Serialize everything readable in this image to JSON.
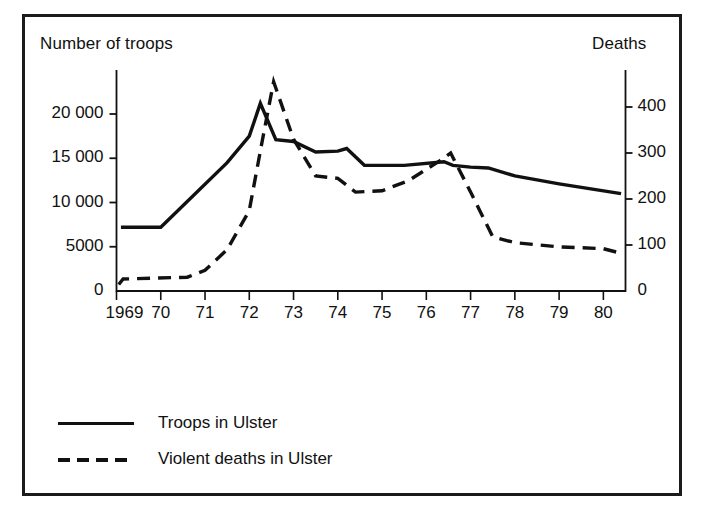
{
  "chart_data": {
    "type": "line",
    "title": "",
    "xlabel": "",
    "ylabel": "Number of troops",
    "y2label": "Deaths",
    "grid": false,
    "legend_position": "bottom-left",
    "x": [
      "1969",
      "70",
      "71",
      "72",
      "73",
      "74",
      "75",
      "76",
      "77",
      "78",
      "79",
      "80"
    ],
    "xtick_labels": [
      "1969",
      "70",
      "71",
      "72",
      "73",
      "74",
      "75",
      "76",
      "77",
      "78",
      "79",
      "80"
    ],
    "xlim": [
      1969,
      1980.5
    ],
    "ylim": [
      0,
      23000
    ],
    "ytick_labels": [
      "0",
      "5000",
      "10 000",
      "15 000",
      "20 000"
    ],
    "ytick_values": [
      0,
      5000,
      10000,
      15000,
      20000
    ],
    "y2lim": [
      0,
      470
    ],
    "y2tick_labels": [
      "0",
      "100",
      "200",
      "300",
      "400"
    ],
    "y2tick_values": [
      0,
      100,
      200,
      300,
      400
    ],
    "series": [
      {
        "name": "Troops in Ulster",
        "axis": "left",
        "style": "solid",
        "color": "#111111",
        "points": [
          {
            "x": 1969.1,
            "y": 7200
          },
          {
            "x": 1970.0,
            "y": 7200
          },
          {
            "x": 1971.5,
            "y": 14500
          },
          {
            "x": 1972.0,
            "y": 17500
          },
          {
            "x": 1972.25,
            "y": 21200
          },
          {
            "x": 1972.6,
            "y": 17100
          },
          {
            "x": 1973.0,
            "y": 16900
          },
          {
            "x": 1973.5,
            "y": 15700
          },
          {
            "x": 1974.0,
            "y": 15800
          },
          {
            "x": 1974.2,
            "y": 16100
          },
          {
            "x": 1974.6,
            "y": 14200
          },
          {
            "x": 1975.5,
            "y": 14200
          },
          {
            "x": 1976.4,
            "y": 14600
          },
          {
            "x": 1976.6,
            "y": 14200
          },
          {
            "x": 1977.0,
            "y": 14000
          },
          {
            "x": 1977.4,
            "y": 13900
          },
          {
            "x": 1978.0,
            "y": 13000
          },
          {
            "x": 1979.0,
            "y": 12100
          },
          {
            "x": 1980.4,
            "y": 11000
          }
        ]
      },
      {
        "name": "Violent deaths in Ulster",
        "axis": "right",
        "style": "dashed",
        "color": "#111111",
        "points": [
          {
            "x": 1969.05,
            "y": 14
          },
          {
            "x": 1969.15,
            "y": 26
          },
          {
            "x": 1970.6,
            "y": 30
          },
          {
            "x": 1971.0,
            "y": 45
          },
          {
            "x": 1971.5,
            "y": 90
          },
          {
            "x": 1972.0,
            "y": 175
          },
          {
            "x": 1972.3,
            "y": 330
          },
          {
            "x": 1972.55,
            "y": 455
          },
          {
            "x": 1973.0,
            "y": 330
          },
          {
            "x": 1973.5,
            "y": 250
          },
          {
            "x": 1974.0,
            "y": 245
          },
          {
            "x": 1974.4,
            "y": 215
          },
          {
            "x": 1975.0,
            "y": 218
          },
          {
            "x": 1975.6,
            "y": 240
          },
          {
            "x": 1976.3,
            "y": 283
          },
          {
            "x": 1976.55,
            "y": 300
          },
          {
            "x": 1977.0,
            "y": 215
          },
          {
            "x": 1977.5,
            "y": 118
          },
          {
            "x": 1978.0,
            "y": 105
          },
          {
            "x": 1979.0,
            "y": 96
          },
          {
            "x": 1980.0,
            "y": 92
          },
          {
            "x": 1980.4,
            "y": 82
          }
        ]
      }
    ],
    "legend": [
      {
        "label": "Troops in Ulster",
        "style": "solid"
      },
      {
        "label": "Violent deaths in Ulster",
        "style": "dashed"
      }
    ]
  },
  "axes": {
    "left_title": "Number of troops",
    "right_title": "Deaths"
  }
}
